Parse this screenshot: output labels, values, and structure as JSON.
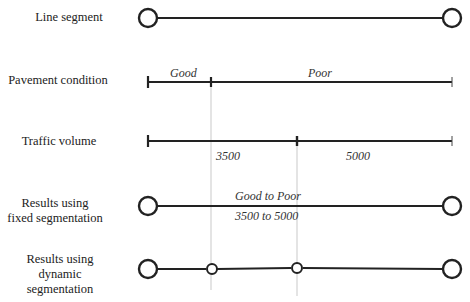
{
  "rows": [
    {
      "label": "Line segment"
    },
    {
      "label": "Pavement condition"
    },
    {
      "label": "Traffic volume"
    },
    {
      "label_line1": "Results using",
      "label_line2": "fixed segmentation"
    },
    {
      "label_line1": "Results using",
      "label_line2": "dynamic",
      "label_line3": "segmentation"
    }
  ],
  "pavement": {
    "seg1": "Good",
    "seg2": "Poor"
  },
  "traffic": {
    "seg1": "3500",
    "seg2": "5000"
  },
  "fixed": {
    "condition": "Good to Poor",
    "volume": "3500 to 5000"
  },
  "colors": {
    "line": "#222222",
    "guide": "#bbbbbb",
    "text": "#333333"
  }
}
